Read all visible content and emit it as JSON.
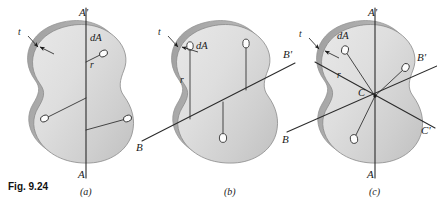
{
  "figure": {
    "caption": "Fig. 9.24",
    "background_color": "#ffffff",
    "line_color": "#2b2b2b",
    "plate_fill_light": "#e3e3e3",
    "plate_fill_mid": "#d2d2d2",
    "plate_fill_dark": "#bdbdbd",
    "plate_edge_band": "#a9a9a9"
  },
  "panels": [
    {
      "id": "a",
      "label": "(a)",
      "thickness_label": "t",
      "element_label": "dA",
      "distance_label": "r",
      "axis_top_label": "A'",
      "axis_bottom_label": "A",
      "axes": [
        {
          "name": "A-A'",
          "orientation": "vertical",
          "top_label": "A'",
          "bottom_label": "A"
        }
      ],
      "area_elements": 3,
      "description": "Vertical axis A-A' with perpendicular distances r from axis to area elements dA"
    },
    {
      "id": "b",
      "label": "(b)",
      "thickness_label": "t",
      "element_label": "dA",
      "distance_label": "r",
      "axis_left_label": "B",
      "axis_right_label": "B'",
      "axes": [
        {
          "name": "B-B'",
          "orientation": "inclined",
          "left_label": "B",
          "right_label": "B'"
        }
      ],
      "area_elements": 3,
      "description": "Inclined axis B-B' with perpendicular distances r from axis to area elements dA"
    },
    {
      "id": "c",
      "label": "(c)",
      "thickness_label": "t",
      "element_label": "dA",
      "distance_label": "r",
      "center_label": "C",
      "axis_top_label": "A'",
      "axis_bottom_label": "A",
      "axis_left_label": "B",
      "axis_right_upper_label": "B'",
      "axis_right_lower_label": "C'",
      "axes": [
        {
          "name": "A-A'",
          "orientation": "vertical",
          "top_label": "A'",
          "bottom_label": "A"
        },
        {
          "name": "B-B'",
          "orientation": "inclined-up",
          "left_label": "B",
          "right_label": "B'"
        },
        {
          "name": "C-C'",
          "orientation": "inclined-down",
          "right_label": "C'"
        }
      ],
      "area_elements": 3,
      "description": "Three concurrent axes through centroid C with radial distances r to area elements dA"
    }
  ]
}
